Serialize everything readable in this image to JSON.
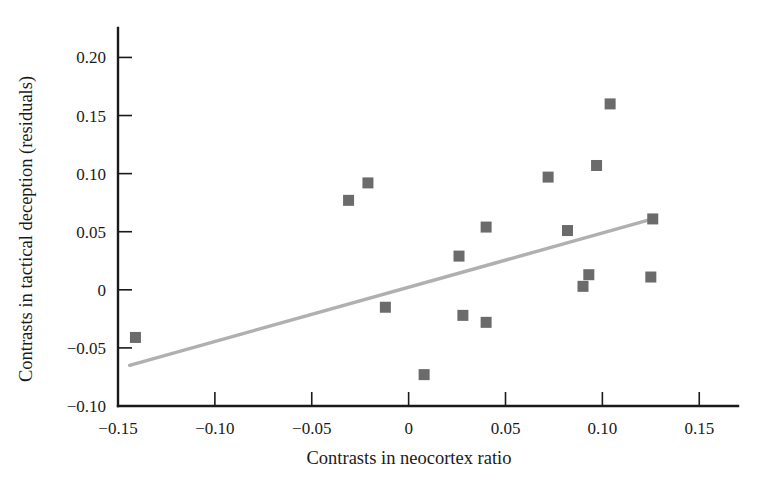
{
  "chart_data": {
    "type": "scatter",
    "title": "",
    "xlabel": "Contrasts in neocortex ratio",
    "ylabel": "Contrasts in tactical deception (residuals)",
    "xlim": [
      -0.15,
      0.17
    ],
    "ylim": [
      -0.1,
      0.215
    ],
    "grid": false,
    "legend": null,
    "xticks": [
      -0.15,
      -0.1,
      -0.05,
      0,
      0.05,
      0.1,
      0.15
    ],
    "xticklabels": [
      "−0.15",
      "−0.10",
      "−0.05",
      "0",
      "0.05",
      "0.10",
      "0.15"
    ],
    "yticks": [
      -0.1,
      -0.05,
      0,
      0.05,
      0.1,
      0.15,
      0.2
    ],
    "yticklabels": [
      "−0.10",
      "−0.05",
      "0",
      "0.05",
      "0.10",
      "0.15",
      "0.20"
    ],
    "marker_shape": "square",
    "marker_color": "#6b6b6b",
    "points": [
      {
        "x": -0.141,
        "y": -0.041
      },
      {
        "x": -0.031,
        "y": 0.077
      },
      {
        "x": -0.021,
        "y": 0.092
      },
      {
        "x": -0.012,
        "y": -0.015
      },
      {
        "x": 0.008,
        "y": -0.073
      },
      {
        "x": 0.026,
        "y": 0.029
      },
      {
        "x": 0.028,
        "y": -0.022
      },
      {
        "x": 0.04,
        "y": 0.054
      },
      {
        "x": 0.04,
        "y": -0.028
      },
      {
        "x": 0.072,
        "y": 0.097
      },
      {
        "x": 0.082,
        "y": 0.051
      },
      {
        "x": 0.09,
        "y": 0.003
      },
      {
        "x": 0.093,
        "y": 0.013
      },
      {
        "x": 0.097,
        "y": 0.107
      },
      {
        "x": 0.104,
        "y": 0.16
      },
      {
        "x": 0.125,
        "y": 0.011
      },
      {
        "x": 0.126,
        "y": 0.061
      }
    ],
    "trendline": {
      "color": "#b0b0b0",
      "x_start": -0.144,
      "y_start": -0.065,
      "x_end": 0.126,
      "y_end": 0.061
    }
  }
}
